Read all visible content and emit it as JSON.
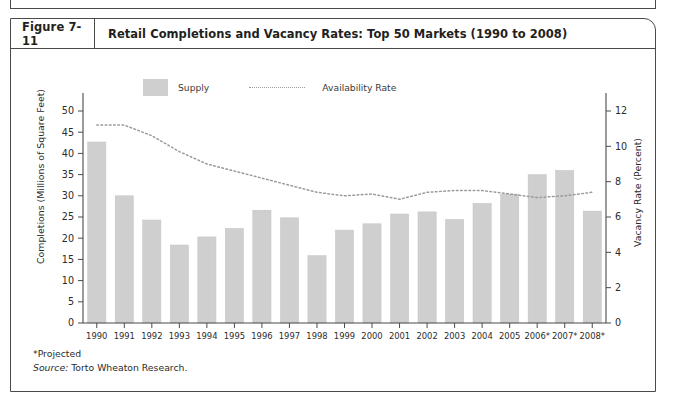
{
  "figure": {
    "number": "Figure 7-11",
    "title": "Retail Completions and Vacancy Rates: Top 50 Markets (1990 to 2008)"
  },
  "legend": {
    "supply_label": "Supply",
    "availability_label": "Availability Rate",
    "supply_swatch_color": "#cfcfcf",
    "availability_line_color": "#9a9a9a"
  },
  "notes": {
    "projected": "*Projected",
    "source_prefix": "Source:",
    "source_value": "Torto Wheaton Research."
  },
  "chart_data": {
    "type": "bar",
    "title": "Retail Completions and Vacancy Rates: Top 50 Markets (1990 to 2008)",
    "xlabel": "",
    "ylabel": "Completions (Millions of Square Feet)",
    "y2label": "Vacancy Rate (Percent)",
    "ylim": [
      0,
      50
    ],
    "y2lim": [
      0,
      12
    ],
    "yticks": [
      0,
      5,
      10,
      15,
      20,
      25,
      30,
      35,
      40,
      45,
      50
    ],
    "y2ticks": [
      0,
      2,
      4,
      6,
      8,
      10,
      12
    ],
    "grid": false,
    "legend_position": "top-left",
    "categories": [
      "1990",
      "1991",
      "1992",
      "1993",
      "1994",
      "1995",
      "1996",
      "1997",
      "1998",
      "1999",
      "2000",
      "2001",
      "2002",
      "2003",
      "2004",
      "2005",
      "2006*",
      "2007*",
      "2008*"
    ],
    "series": [
      {
        "name": "Supply",
        "type": "bar",
        "axis": "left",
        "unit": "Millions of Square Feet",
        "color": "#cfcfcf",
        "values": [
          42.7,
          30.0,
          24.3,
          18.4,
          20.3,
          22.3,
          26.6,
          24.8,
          15.9,
          21.9,
          23.4,
          25.7,
          26.2,
          24.4,
          28.2,
          30.4,
          35.0,
          36.0,
          26.4
        ]
      },
      {
        "name": "Availability Rate",
        "type": "line",
        "style": "dotted",
        "axis": "right",
        "unit": "Percent",
        "color": "#9a9a9a",
        "values": [
          11.2,
          11.2,
          10.6,
          9.7,
          9.0,
          8.6,
          8.2,
          7.8,
          7.4,
          7.2,
          7.3,
          7.0,
          7.4,
          7.5,
          7.5,
          7.3,
          7.1,
          7.2,
          7.4
        ]
      }
    ]
  },
  "axes": {
    "left_title": "Completions (Millions of Square Feet)",
    "right_title": "Vacancy Rate (Percent)"
  }
}
